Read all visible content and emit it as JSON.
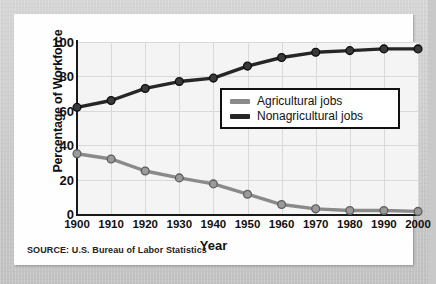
{
  "card": {
    "source_note": "SOURCE: U.S. Bureau of Labor Statistics"
  },
  "legend": {
    "position": "inside-upper-right",
    "entries": [
      {
        "label": "Agricultural jobs",
        "color": "#8a8a8a"
      },
      {
        "label": "Nonagricultural jobs",
        "color": "#262626"
      }
    ]
  },
  "chart_data": {
    "type": "line",
    "title": "",
    "xlabel": "Year",
    "ylabel": "Percentage of Workforce",
    "categories": [
      "1900",
      "1910",
      "1920",
      "1930",
      "1940",
      "1950",
      "1960",
      "1970",
      "1980",
      "1990",
      "2000"
    ],
    "x": [
      1900,
      1910,
      1920,
      1930,
      1940,
      1950,
      1960,
      1970,
      1980,
      1990,
      2000
    ],
    "xlim": [
      1900,
      2000
    ],
    "ylim": [
      0,
      100
    ],
    "yticks": [
      0,
      20,
      40,
      60,
      80,
      100
    ],
    "xticks": [
      1900,
      1910,
      1920,
      1930,
      1940,
      1950,
      1960,
      1970,
      1980,
      1990,
      2000
    ],
    "grid": true,
    "markers": "circle",
    "series": [
      {
        "name": "Agricultural jobs",
        "color": "#8a8a8a",
        "values": [
          35,
          32,
          25,
          21,
          17.5,
          11.5,
          5.5,
          3,
          2,
          2,
          1.5
        ]
      },
      {
        "name": "Nonagricultural jobs",
        "color": "#262626",
        "values": [
          62,
          66,
          73,
          77,
          79,
          86,
          91,
          94,
          95,
          96,
          96
        ]
      }
    ]
  }
}
